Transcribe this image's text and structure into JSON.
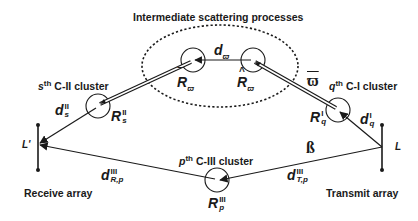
{
  "title": "Intermediate scattering processes",
  "arrays": {
    "receive": {
      "label": "Receive array",
      "node": "L'"
    },
    "transmit": {
      "label": "Transmit array",
      "node": "L"
    }
  },
  "clusters": {
    "c2": {
      "prefix": "s",
      "ord": "th",
      "name": "C-II cluster",
      "radius_sym": "R",
      "radius_sup": "II",
      "radius_sub": "s",
      "dist_sym": "d",
      "dist_sup": "II",
      "dist_sub": "s"
    },
    "c1": {
      "prefix": "q",
      "ord": "th",
      "name": "C-I cluster",
      "radius_sym": "R",
      "radius_sup": "I",
      "radius_sub": "q",
      "dist_sym": "d",
      "dist_sup": "I",
      "dist_sub": "q"
    },
    "c3": {
      "prefix": "p",
      "ord": "th",
      "name": "C-III cluster",
      "radius_sym": "R",
      "radius_sup": "III",
      "radius_sub": "p",
      "dist_r_sym": "d",
      "dist_r_sup": "III",
      "dist_r_sub": "R,p",
      "dist_t_sym": "d",
      "dist_t_sup": "III",
      "dist_t_sub": "T,p"
    }
  },
  "intermediate": {
    "left_radius": {
      "sym": "R",
      "sub": "ϖ",
      "accent": "‾"
    },
    "right_radius": {
      "sym": "R",
      "sub": "ϖ",
      "accent": "^"
    },
    "distance": {
      "sym": "d",
      "sub": "ϖ"
    }
  },
  "symbols": {
    "omega": "ϖ",
    "beta": "ß"
  },
  "colors": {
    "ink": "#1a1a1a",
    "background": "#ffffff"
  }
}
